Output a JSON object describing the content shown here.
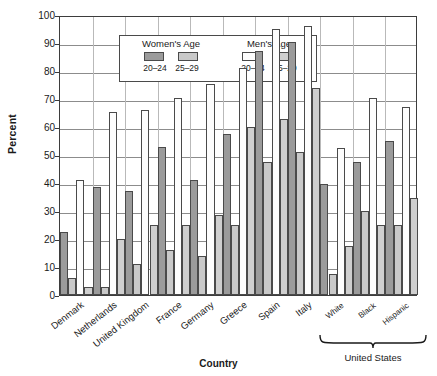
{
  "chart_data": {
    "type": "bar",
    "title": "",
    "xlabel": "Country",
    "ylabel": "Percent",
    "ylim": [
      0,
      100
    ],
    "ytick_values": [
      0,
      10,
      20,
      30,
      40,
      50,
      60,
      70,
      80,
      90,
      100
    ],
    "grid": true,
    "legend_position": "top-left inside plot",
    "categories": [
      "Denmark",
      "Netherlands",
      "United Kingdom",
      "France",
      "Germany",
      "Greece",
      "Spain",
      "Italy",
      "White",
      "Black",
      "Hispanic"
    ],
    "group_annotation": {
      "label": "United States",
      "covers": [
        "White",
        "Black",
        "Hispanic"
      ]
    },
    "series": [
      {
        "name": "Women's Age 20-24",
        "key": "w2024",
        "color": "#9b9b9b",
        "values": [
          22.5,
          38.5,
          37.0,
          53.0,
          41.0,
          57.5,
          87.0,
          90.5,
          39.5,
          47.5,
          55.0
        ]
      },
      {
        "name": "Women's Age 25-29",
        "key": "w2529",
        "color": "#c9c9c9",
        "values": [
          6.0,
          3.0,
          11.0,
          16.0,
          14.0,
          25.0,
          47.5,
          51.0,
          7.5,
          30.0,
          25.0
        ]
      },
      {
        "name": "Men's Age 20-24",
        "key": "m2024",
        "color": "#fdfdfd",
        "values": [
          41.0,
          65.5,
          66.0,
          70.5,
          75.5,
          81.0,
          95.0,
          96.0,
          52.5,
          70.5,
          67.0
        ]
      },
      {
        "name": "Men's Age 25-29",
        "key": "m2529",
        "color": "#cfcfcf",
        "values": [
          3.0,
          20.0,
          25.0,
          25.0,
          28.5,
          60.0,
          63.0,
          74.0,
          17.5,
          25.0,
          34.5
        ]
      }
    ]
  },
  "legend": {
    "women": {
      "title": "Women's Age",
      "keys": [
        "20–24",
        "25–29"
      ]
    },
    "men": {
      "title": "Men's Age",
      "keys": [
        "20–24",
        "25–29"
      ]
    }
  },
  "axis": {
    "ylabel": "Percent",
    "xlabel": "Country"
  }
}
